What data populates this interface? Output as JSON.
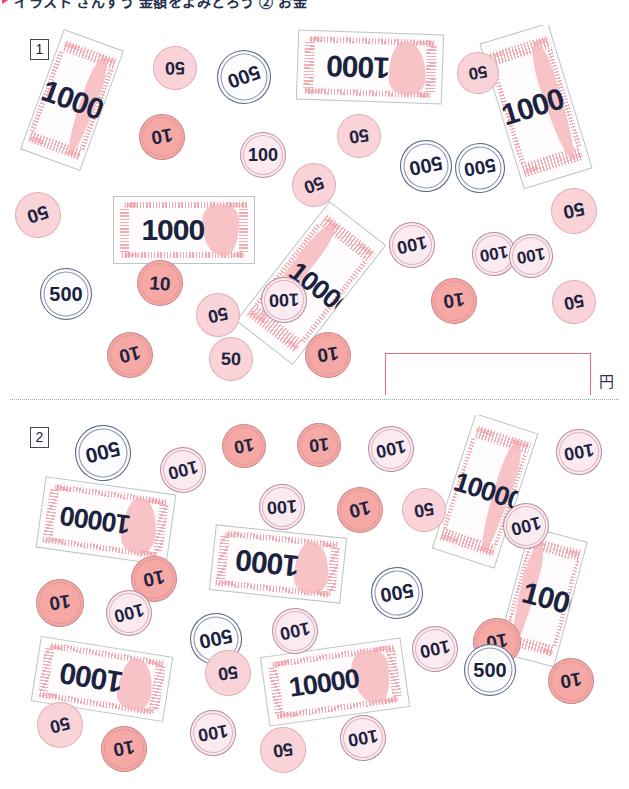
{
  "header": {
    "marker": "red-triangle-marker",
    "title": "イラスト さんすう 金額をよみとろう ② お金"
  },
  "answer_unit": "円",
  "panels": [
    {
      "number": "1",
      "answer_box": {
        "value": "",
        "unit": "円"
      },
      "notes": [
        {
          "denom": "1000",
          "x": 40,
          "y": 36,
          "w": 64,
          "h": 128,
          "rot": 20,
          "flip": false
        },
        {
          "denom": "1000",
          "x": 297,
          "y": 32,
          "w": 146,
          "h": 70,
          "rot": 182,
          "flip": true
        },
        {
          "denom": "1000",
          "x": 500,
          "y": 30,
          "w": 72,
          "h": 152,
          "rot": -17,
          "flip": false
        },
        {
          "denom": "1000",
          "x": 113,
          "y": 196,
          "w": 142,
          "h": 68,
          "rot": 0,
          "flip": false
        },
        {
          "denom": "10000",
          "x": 275,
          "y": 207,
          "w": 72,
          "h": 152,
          "rot": 38,
          "flip": true
        }
      ],
      "coins": [
        {
          "denom": "50",
          "x": 153,
          "y": 46,
          "d": 44,
          "rot": 178,
          "fs": 18
        },
        {
          "denom": "500",
          "x": 217,
          "y": 50,
          "d": 54,
          "rot": 160,
          "fs": 20
        },
        {
          "denom": "50",
          "x": 457,
          "y": 52,
          "d": 42,
          "rot": 170,
          "fs": 17
        },
        {
          "denom": "10",
          "x": 139,
          "y": 114,
          "d": 46,
          "rot": 170,
          "fs": 19
        },
        {
          "denom": "100",
          "x": 240,
          "y": 132,
          "d": 46,
          "rot": 0,
          "fs": 18
        },
        {
          "denom": "50",
          "x": 337,
          "y": 114,
          "d": 44,
          "rot": 172,
          "fs": 18
        },
        {
          "denom": "500",
          "x": 400,
          "y": 140,
          "d": 52,
          "rot": 168,
          "fs": 20
        },
        {
          "denom": "500",
          "x": 455,
          "y": 143,
          "d": 50,
          "rot": 170,
          "fs": 19
        },
        {
          "denom": "50",
          "x": 15,
          "y": 192,
          "d": 46,
          "rot": 162,
          "fs": 19
        },
        {
          "denom": "50",
          "x": 292,
          "y": 163,
          "d": 44,
          "rot": 160,
          "fs": 18
        },
        {
          "denom": "100",
          "x": 389,
          "y": 222,
          "d": 46,
          "rot": 168,
          "fs": 18
        },
        {
          "denom": "50",
          "x": 551,
          "y": 188,
          "d": 46,
          "rot": 168,
          "fs": 19
        },
        {
          "denom": "10",
          "x": 137,
          "y": 260,
          "d": 46,
          "rot": 4,
          "fs": 19
        },
        {
          "denom": "100",
          "x": 472,
          "y": 232,
          "d": 44,
          "rot": 170,
          "fs": 17
        },
        {
          "denom": "100",
          "x": 509,
          "y": 234,
          "d": 44,
          "rot": 170,
          "fs": 17
        },
        {
          "denom": "500",
          "x": 40,
          "y": 268,
          "d": 52,
          "rot": 0,
          "fs": 20
        },
        {
          "denom": "50",
          "x": 196,
          "y": 293,
          "d": 44,
          "rot": 168,
          "fs": 18
        },
        {
          "denom": "100",
          "x": 261,
          "y": 277,
          "d": 46,
          "rot": 178,
          "fs": 18
        },
        {
          "denom": "10",
          "x": 431,
          "y": 278,
          "d": 46,
          "rot": 172,
          "fs": 19
        },
        {
          "denom": "50",
          "x": 552,
          "y": 280,
          "d": 44,
          "rot": 168,
          "fs": 18
        },
        {
          "denom": "10",
          "x": 107,
          "y": 332,
          "d": 46,
          "rot": 166,
          "fs": 19
        },
        {
          "denom": "50",
          "x": 209,
          "y": 337,
          "d": 44,
          "rot": 2,
          "fs": 18
        },
        {
          "denom": "10",
          "x": 305,
          "y": 332,
          "d": 46,
          "rot": 172,
          "fs": 19
        }
      ]
    },
    {
      "number": "2",
      "answer_box": {
        "value": "",
        "unit": "円"
      },
      "notes": [
        {
          "denom": "10000",
          "x": 40,
          "y": 485,
          "w": 132,
          "h": 72,
          "rot": 188,
          "flip": true
        },
        {
          "denom": "10000",
          "x": 452,
          "y": 420,
          "w": 66,
          "h": 142,
          "rot": 18,
          "flip": false
        },
        {
          "denom": "1000",
          "x": 212,
          "y": 531,
          "w": 132,
          "h": 66,
          "rot": 186,
          "flip": true
        },
        {
          "denom": "1000",
          "x": 512,
          "y": 532,
          "w": 60,
          "h": 130,
          "rot": 15,
          "flip": true
        },
        {
          "denom": "1000",
          "x": 35,
          "y": 646,
          "w": 134,
          "h": 66,
          "rot": 189,
          "flip": true
        },
        {
          "denom": "10000",
          "x": 264,
          "y": 647,
          "w": 142,
          "h": 70,
          "rot": 352,
          "flip": false
        }
      ],
      "coins": [
        {
          "denom": "500",
          "x": 75,
          "y": 425,
          "d": 56,
          "rot": 166,
          "fs": 21
        },
        {
          "denom": "100",
          "x": 160,
          "y": 447,
          "d": 46,
          "rot": 166,
          "fs": 18
        },
        {
          "denom": "10",
          "x": 222,
          "y": 424,
          "d": 44,
          "rot": 170,
          "fs": 18
        },
        {
          "denom": "10",
          "x": 297,
          "y": 423,
          "d": 44,
          "rot": 174,
          "fs": 18
        },
        {
          "denom": "100",
          "x": 368,
          "y": 426,
          "d": 46,
          "rot": 168,
          "fs": 18
        },
        {
          "denom": "100",
          "x": 556,
          "y": 429,
          "d": 46,
          "rot": 170,
          "fs": 18
        },
        {
          "denom": "100",
          "x": 259,
          "y": 484,
          "d": 46,
          "rot": 176,
          "fs": 18
        },
        {
          "denom": "10",
          "x": 337,
          "y": 487,
          "d": 46,
          "rot": 166,
          "fs": 19
        },
        {
          "denom": "50",
          "x": 402,
          "y": 488,
          "d": 44,
          "rot": 170,
          "fs": 18
        },
        {
          "denom": "100",
          "x": 503,
          "y": 503,
          "d": 46,
          "rot": 166,
          "fs": 18
        },
        {
          "denom": "10",
          "x": 131,
          "y": 556,
          "d": 46,
          "rot": 168,
          "fs": 19
        },
        {
          "denom": "500",
          "x": 371,
          "y": 567,
          "d": 52,
          "rot": 170,
          "fs": 20
        },
        {
          "denom": "10",
          "x": 36,
          "y": 579,
          "d": 48,
          "rot": 172,
          "fs": 19
        },
        {
          "denom": "100",
          "x": 106,
          "y": 590,
          "d": 46,
          "rot": 166,
          "fs": 18
        },
        {
          "denom": "500",
          "x": 190,
          "y": 613,
          "d": 52,
          "rot": 168,
          "fs": 20
        },
        {
          "denom": "100",
          "x": 272,
          "y": 608,
          "d": 46,
          "rot": 168,
          "fs": 18
        },
        {
          "denom": "10",
          "x": 473,
          "y": 618,
          "d": 48,
          "rot": 170,
          "fs": 19
        },
        {
          "denom": "100",
          "x": 412,
          "y": 626,
          "d": 46,
          "rot": 168,
          "fs": 18
        },
        {
          "denom": "50",
          "x": 205,
          "y": 650,
          "d": 46,
          "rot": 172,
          "fs": 18
        },
        {
          "denom": "500",
          "x": 464,
          "y": 644,
          "d": 52,
          "rot": 0,
          "fs": 20
        },
        {
          "denom": "10",
          "x": 548,
          "y": 658,
          "d": 46,
          "rot": 170,
          "fs": 19
        },
        {
          "denom": "50",
          "x": 37,
          "y": 702,
          "d": 46,
          "rot": 166,
          "fs": 18
        },
        {
          "denom": "10",
          "x": 101,
          "y": 726,
          "d": 46,
          "rot": 170,
          "fs": 19
        },
        {
          "denom": "100",
          "x": 190,
          "y": 710,
          "d": 46,
          "rot": 170,
          "fs": 18
        },
        {
          "denom": "50",
          "x": 260,
          "y": 727,
          "d": 46,
          "rot": 172,
          "fs": 18
        },
        {
          "denom": "100",
          "x": 340,
          "y": 715,
          "d": 46,
          "rot": 170,
          "fs": 18
        }
      ]
    }
  ]
}
